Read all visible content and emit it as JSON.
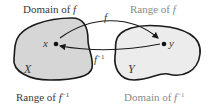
{
  "diagram": {
    "title_labels": {
      "domain_f": {
        "prefix": "Domain of ",
        "fn": "f",
        "sup": ""
      },
      "range_f": {
        "prefix": "Range of ",
        "fn": "f",
        "sup": ""
      },
      "range_finv": {
        "prefix": "Range of ",
        "fn": "f",
        "sup": "−1"
      },
      "domain_finv": {
        "prefix": "Domain of ",
        "fn": "f",
        "sup": "−1"
      }
    },
    "sets": [
      {
        "name": "X",
        "fill": "#d6d6d6"
      },
      {
        "name": "Y",
        "fill": "#ececec"
      }
    ],
    "points": [
      {
        "name": "x"
      },
      {
        "name": "y"
      }
    ],
    "arrows": [
      {
        "label": "f",
        "sup": "",
        "from": "x",
        "to": "y"
      },
      {
        "label": "f",
        "sup": "−1",
        "from": "y",
        "to": "x"
      }
    ],
    "colors": {
      "stroke": "#1a1a1a",
      "dark_text": "#3a3a3a",
      "light_text": "#8a8a8a"
    }
  }
}
